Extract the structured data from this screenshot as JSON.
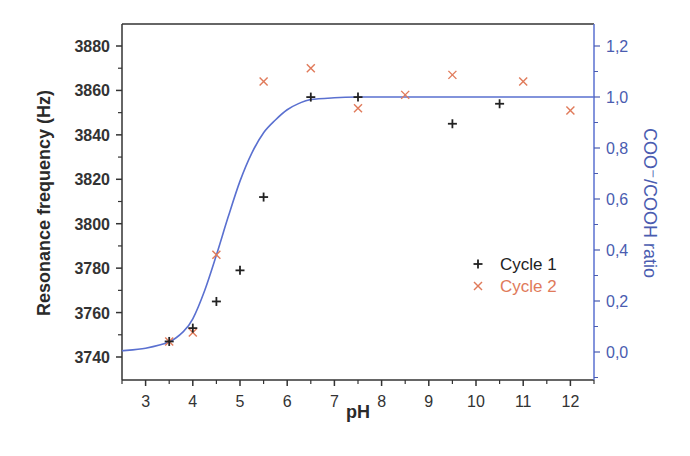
{
  "chart_data": {
    "type": "scatter",
    "title": "",
    "xlabel": "pH",
    "ylabel": "Resonance frequency (Hz)",
    "y2label": "COO⁻/COOH ratio",
    "xlim": [
      2.5,
      12.5
    ],
    "ylim": [
      3730,
      3890
    ],
    "y2lim": [
      -0.12,
      1.28
    ],
    "xticks": [
      3,
      4,
      5,
      6,
      7,
      8,
      9,
      10,
      11,
      12
    ],
    "yticks": [
      3740,
      3760,
      3780,
      3800,
      3820,
      3840,
      3860,
      3880
    ],
    "y2ticks": [
      "0,0",
      "0,2",
      "0,4",
      "0,6",
      "0,8",
      "1,0",
      "1,2"
    ],
    "y2tick_values": [
      0.0,
      0.2,
      0.4,
      0.6,
      0.8,
      1.0,
      1.2
    ],
    "grid": false,
    "legend_position": "center-right",
    "series": [
      {
        "name": "Cycle 1",
        "marker": "+",
        "color": "#222222",
        "axis": "left",
        "x": [
          3.5,
          4.0,
          4.5,
          5.0,
          5.5,
          6.5,
          7.5,
          9.5,
          10.5
        ],
        "y": [
          3747,
          3753,
          3765,
          3779,
          3812,
          3857,
          3857,
          3845,
          3854
        ]
      },
      {
        "name": "Cycle 2",
        "marker": "x",
        "color": "#e07a5a",
        "axis": "left",
        "x": [
          3.5,
          4.0,
          4.5,
          5.5,
          6.5,
          7.5,
          8.5,
          9.5,
          11.0,
          12.0
        ],
        "y": [
          3747,
          3751,
          3786,
          3864,
          3870,
          3852,
          3858,
          3867,
          3864,
          3851
        ]
      },
      {
        "name": "COO⁻/COOH ratio",
        "type": "line",
        "color": "#5a70d0",
        "axis": "right",
        "x": [
          2.5,
          3.0,
          3.5,
          3.8,
          4.0,
          4.25,
          4.5,
          4.75,
          5.0,
          5.25,
          5.5,
          5.75,
          6.0,
          6.25,
          6.5,
          7.0,
          7.5,
          8.0,
          9.0,
          10.0,
          11.0,
          12.0,
          12.5
        ],
        "y": [
          0.005,
          0.015,
          0.04,
          0.08,
          0.13,
          0.24,
          0.38,
          0.53,
          0.67,
          0.78,
          0.86,
          0.91,
          0.95,
          0.975,
          0.99,
          0.997,
          1.0,
          1.0,
          1.0,
          1.0,
          1.0,
          1.0,
          1.0
        ]
      }
    ]
  },
  "legend": {
    "items": [
      {
        "label": "Cycle 1",
        "symbol": "+",
        "color": "#222222"
      },
      {
        "label": "Cycle 2",
        "symbol": "×",
        "color": "#e07a5a"
      }
    ]
  },
  "colors": {
    "axis_left": "#333333",
    "axis_right": "#4a5cb0",
    "curve": "#5a70d0",
    "cycle1": "#222222",
    "cycle2": "#e07a5a"
  }
}
